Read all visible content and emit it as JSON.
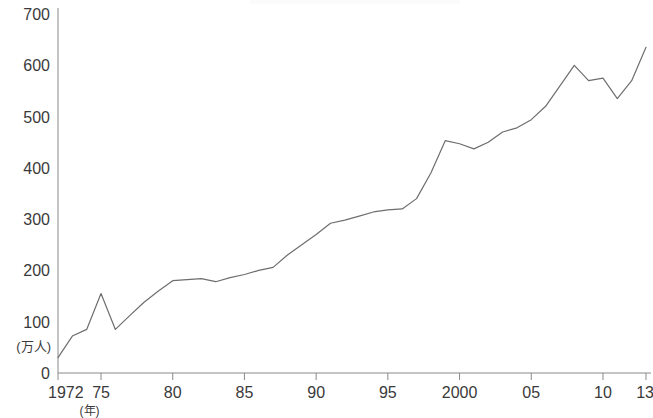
{
  "chart_data": {
    "type": "line",
    "title": "",
    "subtitle": "",
    "xlabel": "(年)",
    "ylabel": "(万人)",
    "xlim": [
      1972,
      2013
    ],
    "ylim": [
      0,
      700
    ],
    "grid": false,
    "legend": false,
    "legend_position": "none",
    "y_ticks": [
      0,
      100,
      200,
      300,
      400,
      500,
      600,
      700
    ],
    "y_tick_labels": [
      "0",
      "100",
      "200",
      "300",
      "400",
      "500",
      "600",
      "700"
    ],
    "x_ticks": [
      1972,
      1975,
      1980,
      1985,
      1990,
      1995,
      2000,
      2005,
      2010,
      2013
    ],
    "x_tick_labels": [
      "1972",
      "75",
      "80",
      "85",
      "90",
      "95",
      "2000",
      "05",
      "10",
      "13"
    ],
    "series": [
      {
        "name": "",
        "x": [
          1972,
          1973,
          1974,
          1975,
          1976,
          1977,
          1978,
          1979,
          1980,
          1981,
          1982,
          1983,
          1984,
          1985,
          1986,
          1987,
          1988,
          1989,
          1990,
          1991,
          1992,
          1993,
          1994,
          1995,
          1996,
          1997,
          1998,
          1999,
          2000,
          2001,
          2002,
          2003,
          2004,
          2005,
          2006,
          2007,
          2008,
          2009,
          2010,
          2011,
          2012,
          2013
        ],
        "values": [
          30,
          72,
          85,
          155,
          85,
          112,
          138,
          160,
          180,
          182,
          184,
          178,
          186,
          192,
          200,
          206,
          230,
          250,
          270,
          292,
          298,
          306,
          314,
          318,
          320,
          340,
          390,
          453,
          447,
          437,
          450,
          470,
          478,
          494,
          520,
          560,
          600,
          570,
          575,
          535,
          570,
          635
        ]
      }
    ],
    "units": "万人",
    "annotations": []
  },
  "axis": {
    "y_unit_label": "(万人)",
    "x_unit_label": "(年)"
  }
}
